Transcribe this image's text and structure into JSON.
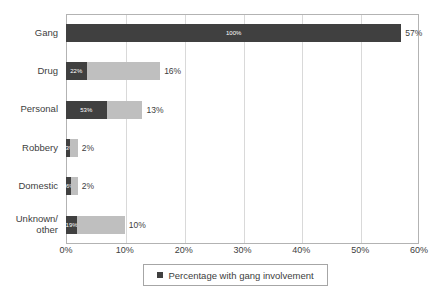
{
  "chart_data": {
    "type": "bar",
    "orientation": "horizontal",
    "stacked": true,
    "title": "",
    "xlabel": "",
    "ylabel": "",
    "xlim": [
      0,
      60
    ],
    "xticks": [
      "0%",
      "10%",
      "20%",
      "30%",
      "40%",
      "50%",
      "60%"
    ],
    "xtick_values": [
      0,
      10,
      20,
      30,
      40,
      50,
      60
    ],
    "grid": "vertical",
    "categories": [
      "Gang",
      "Drug",
      "Personal",
      "Robbery",
      "Domestic",
      "Unknown/\nother"
    ],
    "series": [
      {
        "name": "Percentage with gang involvement",
        "color": "#404040",
        "values": [
          57,
          3.5,
          6.9,
          0.7,
          0.9,
          1.9
        ],
        "inner_labels": [
          "100%",
          "22%",
          "53%",
          "33%",
          "46%",
          "19%"
        ]
      },
      {
        "name": "Remainder",
        "color": "#bfbfbf",
        "values": [
          0,
          12.5,
          6.1,
          1.3,
          1.1,
          8.1
        ],
        "inner_labels": [
          "",
          "",
          "",
          "",
          "",
          ""
        ]
      }
    ],
    "totals": [
      57,
      16,
      13,
      2,
      2,
      10
    ],
    "total_labels": [
      "57%",
      "16%",
      "13%",
      "2%",
      "2%",
      "10%"
    ],
    "legend": {
      "position": "bottom",
      "entries": [
        {
          "label": "Percentage with gang involvement",
          "color": "#404040"
        }
      ]
    },
    "colors": {
      "dark": "#404040",
      "light": "#bfbfbf",
      "gridline": "#d9d9d9",
      "frame": "#b3b3b3",
      "text": "#404040",
      "background": "#ffffff"
    }
  }
}
